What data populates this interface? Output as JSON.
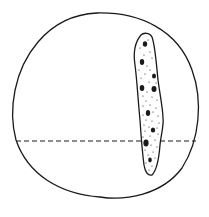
{
  "figure": {
    "colors": {
      "background": "#ffffff",
      "stroke": "#1a1a1a"
    },
    "circle": {
      "cx": 106,
      "cy": 105,
      "rx": 94,
      "ry": 92
    },
    "dashed_line": {
      "y": 141,
      "x1": 16,
      "x2": 196
    },
    "inclusion": {
      "top_y": 33,
      "bottom_y": 175,
      "center_x": 150
    }
  }
}
